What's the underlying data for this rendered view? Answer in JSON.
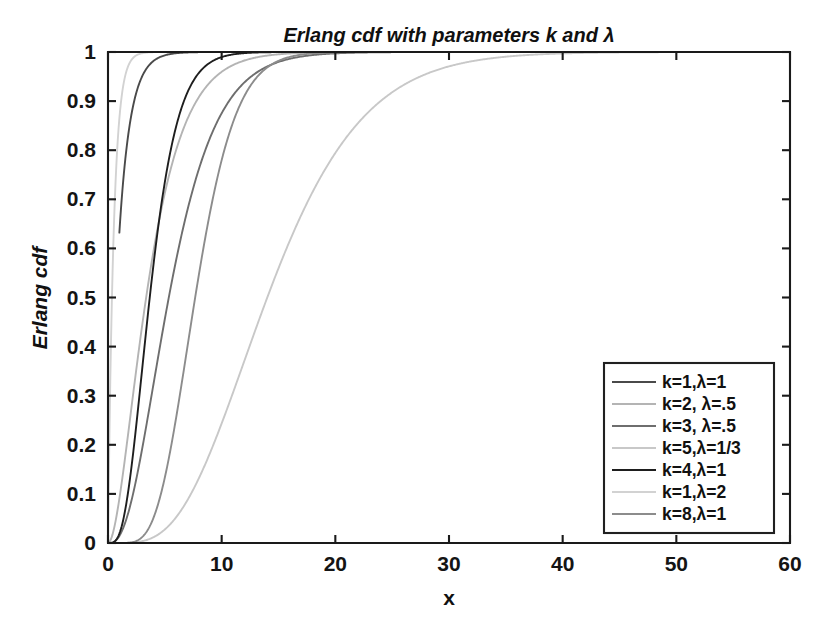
{
  "chart_data": {
    "type": "line",
    "title": "Erlang cdf with parameters k and λ",
    "xlabel": "x",
    "ylabel": "Erlang cdf",
    "xlim": [
      0,
      60
    ],
    "ylim": [
      0,
      1
    ],
    "xticks": [
      "0",
      "10",
      "20",
      "30",
      "40",
      "50",
      "60"
    ],
    "xtick_values": [
      0,
      10,
      20,
      30,
      40,
      50,
      60
    ],
    "yticks": [
      "0",
      "0.1",
      "0.2",
      "0.3",
      "0.4",
      "0.5",
      "0.6",
      "0.7",
      "0.8",
      "0.9",
      "1"
    ],
    "ytick_values": [
      0,
      0.1,
      0.2,
      0.3,
      0.4,
      0.5,
      0.6,
      0.7,
      0.8,
      0.9,
      1
    ],
    "grid": false,
    "legend_position": "lower-right",
    "background": "#ffffff",
    "axis_color": "#1a1a1a",
    "series": [
      {
        "name": "k=1,λ=1",
        "k": 1,
        "lambda": 1,
        "color": "#4a4a4a",
        "x_start": 1
      },
      {
        "name": "k=2, λ=.5",
        "k": 2,
        "lambda": 0.5,
        "color": "#b4b4b4",
        "x_start": 0
      },
      {
        "name": "k=3, λ=.5",
        "k": 3,
        "lambda": 0.5,
        "color": "#6e6e6e",
        "x_start": 0
      },
      {
        "name": "k=5,λ=1/3",
        "k": 5,
        "lambda": 0.333333,
        "color": "#c8c8c8",
        "x_start": 0
      },
      {
        "name": "k=4,λ=1",
        "k": 4,
        "lambda": 1,
        "color": "#1e1e1e",
        "x_start": 0
      },
      {
        "name": "k=1,λ=2",
        "k": 1,
        "lambda": 2,
        "color": "#d2d2d2",
        "x_start": 0
      },
      {
        "name": "k=8,λ=1",
        "k": 8,
        "lambda": 1,
        "color": "#8c8c8c",
        "x_start": 0
      }
    ]
  }
}
